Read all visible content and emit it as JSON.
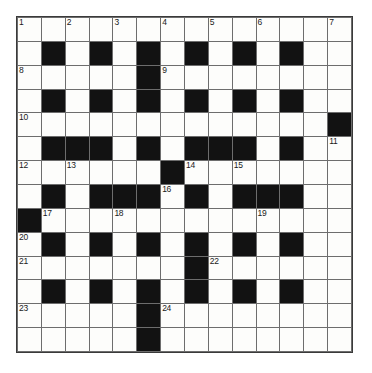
{
  "puzzle": {
    "title": "Crossword Grid",
    "rows": 14,
    "cols": 14,
    "colors": {
      "block": "#121212",
      "open": "#fdfdfb",
      "gridline": "#6d6d6d",
      "border": "#3a3a3a",
      "number_text": "#1a1a1a"
    },
    "grid": [
      "..............",
      ".#.#.#.#.#.#..",
      ".....#........",
      ".#.#.#.#.#.#..",
      ".............#",
      ".###.#.###.#..",
      "......#.......",
      ".#.###.#.###..",
      "#.............",
      ".#.#.#.#.#.#..",
      ".......#......",
      ".#.#.#.#.#.#..",
      ".....#........",
      ".....#........"
    ],
    "numbers": [
      {
        "n": "1",
        "row": 0,
        "col": 0
      },
      {
        "n": "2",
        "row": 0,
        "col": 2
      },
      {
        "n": "3",
        "row": 0,
        "col": 4
      },
      {
        "n": "4",
        "row": 0,
        "col": 6
      },
      {
        "n": "5",
        "row": 0,
        "col": 8
      },
      {
        "n": "6",
        "row": 0,
        "col": 10
      },
      {
        "n": "7",
        "row": 0,
        "col": 13
      },
      {
        "n": "8",
        "row": 2,
        "col": 0
      },
      {
        "n": "9",
        "row": 2,
        "col": 6
      },
      {
        "n": "10",
        "row": 4,
        "col": 0
      },
      {
        "n": "11",
        "row": 5,
        "col": 13
      },
      {
        "n": "12",
        "row": 6,
        "col": 0
      },
      {
        "n": "13",
        "row": 6,
        "col": 2
      },
      {
        "n": "14",
        "row": 6,
        "col": 7
      },
      {
        "n": "15",
        "row": 6,
        "col": 9
      },
      {
        "n": "16",
        "row": 7,
        "col": 6
      },
      {
        "n": "17",
        "row": 8,
        "col": 1
      },
      {
        "n": "18",
        "row": 8,
        "col": 4
      },
      {
        "n": "19",
        "row": 8,
        "col": 10
      },
      {
        "n": "20",
        "row": 9,
        "col": 0
      },
      {
        "n": "21",
        "row": 10,
        "col": 0
      },
      {
        "n": "22",
        "row": 10,
        "col": 8
      },
      {
        "n": "23",
        "row": 12,
        "col": 0
      },
      {
        "n": "24",
        "row": 12,
        "col": 6
      }
    ],
    "entries": []
  }
}
